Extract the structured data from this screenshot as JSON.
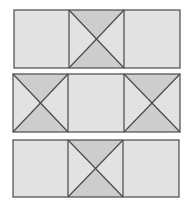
{
  "diagram": {
    "colors": {
      "background": "#ffffff",
      "tile_fill": "#e2e2e2",
      "triangle_fill": "#cdcdcd",
      "stroke": "#4a4a4a"
    },
    "rows": [
      {
        "y": 10,
        "h": 58,
        "x": [
          14,
          69,
          124,
          180
        ],
        "crossed": [
          false,
          true,
          false
        ],
        "shaded": [
          "",
          "tb",
          ""
        ]
      },
      {
        "y": 74,
        "h": 58,
        "x": [
          13,
          68,
          124,
          180
        ],
        "crossed": [
          true,
          false,
          true
        ],
        "shaded": [
          "tb",
          "",
          "tb"
        ]
      },
      {
        "y": 140,
        "h": 57,
        "x": [
          13,
          68,
          123,
          179
        ],
        "crossed": [
          false,
          true,
          false
        ],
        "shaded": [
          "",
          "tb",
          ""
        ]
      }
    ]
  }
}
